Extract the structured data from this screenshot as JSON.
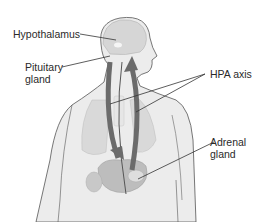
{
  "diagram": {
    "labels": {
      "hypothalamus": "Hypothalamus",
      "pituitary": "Pituitary\ngland",
      "hpa_axis": "HPA axis",
      "adrenal": "Adrenal\ngland"
    },
    "colors": {
      "body_fill": "#ececec",
      "body_outline": "#555555",
      "organ_fill": "#c8c8c8",
      "arrow_fill": "#6b6b6b",
      "leader_line": "#333333",
      "text": "#2a2a2a"
    }
  }
}
